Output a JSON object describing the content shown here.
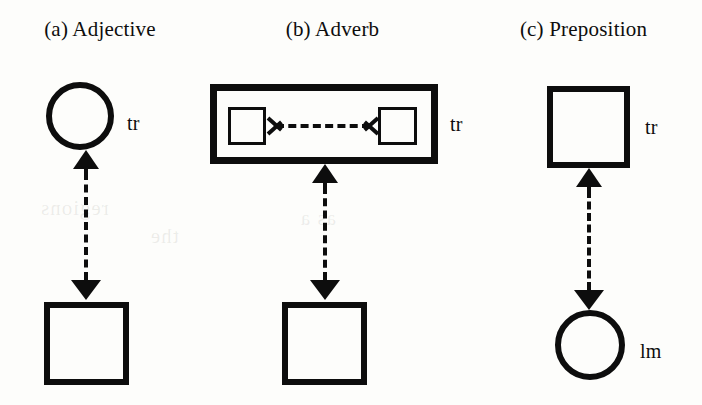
{
  "figure": {
    "background_color": "#fdfdfb",
    "ink_color": "#0d0d0d",
    "panels": [
      {
        "id": "adjective",
        "caption": "(a) Adjective",
        "top_shape": "circle",
        "top_label": "tr",
        "bottom_shape": "square",
        "bottom_label": "",
        "link": "vertical-dashed-double-arrow"
      },
      {
        "id": "adverb",
        "caption": "(b) Adverb",
        "top_shape": "rectangle-with-two-inner-squares",
        "top_label": "tr",
        "bottom_shape": "square",
        "bottom_label": "",
        "link": "vertical-dashed-double-arrow",
        "inner_link": "horizontal-dashed-double-arrow"
      },
      {
        "id": "preposition",
        "caption": "(c) Preposition",
        "top_shape": "square",
        "top_label": "tr",
        "bottom_shape": "circle",
        "bottom_label": "lm",
        "link": "vertical-dashed-double-arrow"
      }
    ],
    "bleed_through_artifact": [
      "regions",
      "the",
      "as a"
    ]
  }
}
